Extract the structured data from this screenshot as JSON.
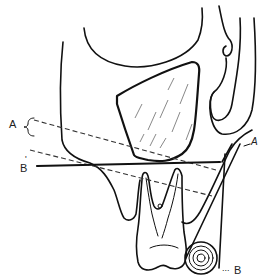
{
  "diagram": {
    "type": "line-drawing",
    "colors": {
      "line": "#111111",
      "background": "#ffffff"
    },
    "labels": {
      "a_left": "A",
      "a_right": "A",
      "b_prime": "B",
      "b_prime_mark": "'",
      "b_lower": "B",
      "b_lower_leader": "..."
    }
  }
}
